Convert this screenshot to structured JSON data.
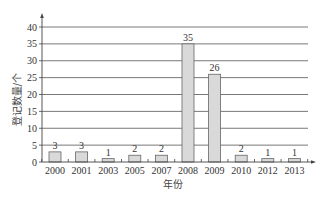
{
  "chart_data": {
    "type": "bar",
    "title": "",
    "xlabel": "年份",
    "ylabel": "登记数量/个",
    "categories": [
      "2000",
      "2001",
      "2003",
      "2005",
      "2007",
      "2008",
      "2009",
      "2010",
      "2012",
      "2013"
    ],
    "values": [
      3,
      3,
      1,
      2,
      2,
      35,
      26,
      2,
      1,
      1
    ],
    "data_labels": [
      "3",
      "3",
      "1",
      "2",
      "2",
      "35",
      "26",
      "2",
      "1",
      "1"
    ],
    "ylim": [
      0,
      40
    ],
    "yticks": [
      0,
      5,
      10,
      15,
      20,
      25,
      30,
      35,
      40
    ],
    "ytick_labels": [
      "0",
      "5",
      "10",
      "15",
      "20",
      "25",
      "30",
      "35",
      "40"
    ],
    "grid": "horizontal",
    "legend": "none",
    "colors": {
      "bar_fill": "#d9d9d9",
      "bar_stroke": "#666666",
      "grid": "#555555",
      "axis": "#444444"
    }
  }
}
